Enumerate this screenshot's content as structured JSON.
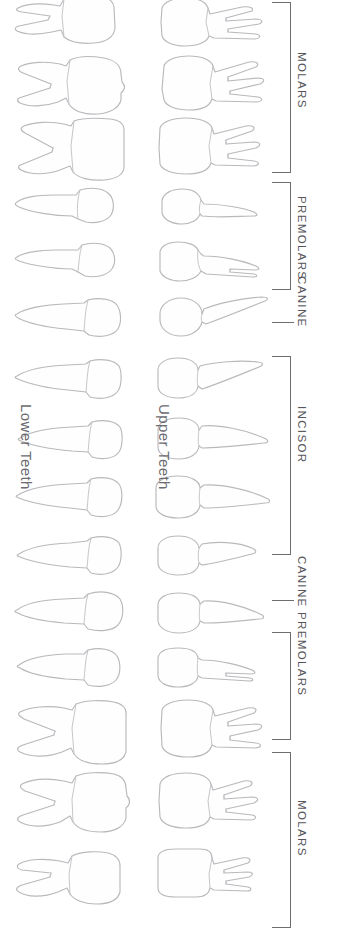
{
  "figure": {
    "background_color": "#ffffff",
    "outline_color": "#b9b9bd",
    "bracket_color": "#6d6d72",
    "label_color": "#55555a"
  },
  "arch_labels": [
    {
      "name": "lower-teeth-label",
      "text": "Lower Teeth",
      "x": 34,
      "y": 404
    },
    {
      "name": "upper-teeth-label",
      "text": "Upper Teeth",
      "x": 172,
      "y": 404
    }
  ],
  "groups": [
    {
      "name": "molars-upper",
      "label": "MOLARS",
      "marker": "bracket",
      "top": 2,
      "height": 171,
      "label_y": 52
    },
    {
      "name": "premolars-upper",
      "label": "PREMOLARS",
      "marker": "bracket",
      "top": 182,
      "height": 108,
      "label_y": 196
    },
    {
      "name": "canine-upper",
      "label": "CANINE",
      "marker": "tick",
      "top": 322,
      "height": 0,
      "label_y": 276
    },
    {
      "name": "incisor",
      "label": "INCISOR",
      "marker": "bracket",
      "top": 356,
      "height": 199,
      "label_y": 406
    },
    {
      "name": "canine-lower",
      "label": "CANINE",
      "marker": "tick",
      "top": 600,
      "height": 0,
      "label_y": 556
    },
    {
      "name": "premolars-lower",
      "label": "PREMOLARS",
      "marker": "bracket",
      "top": 632,
      "height": 108,
      "label_y": 612
    },
    {
      "name": "molars-lower",
      "label": "MOLARS",
      "marker": "bracket",
      "top": 752,
      "height": 176,
      "label_y": 800
    }
  ],
  "columns": [
    {
      "name": "lower-teeth-column",
      "side": "lower",
      "x": 14,
      "orientation": "root-left-crown-right"
    },
    {
      "name": "upper-teeth-column",
      "side": "upper",
      "x": 152,
      "orientation": "crown-left-root-right"
    }
  ],
  "rows": [
    {
      "name": "third-molar-row",
      "group": "molars",
      "y": 0,
      "lower_tooth": "lower-third-molar",
      "upper_tooth": "upper-third-molar"
    },
    {
      "name": "second-molar-row",
      "group": "molars",
      "y": 58,
      "lower_tooth": "lower-second-molar",
      "upper_tooth": "upper-second-molar"
    },
    {
      "name": "first-molar-row",
      "group": "molars",
      "y": 120,
      "lower_tooth": "lower-first-molar",
      "upper_tooth": "upper-first-molar"
    },
    {
      "name": "second-premolar-row",
      "group": "premolars",
      "y": 186,
      "lower_tooth": "lower-second-premolar",
      "upper_tooth": "upper-second-premolar"
    },
    {
      "name": "first-premolar-row",
      "group": "premolars",
      "y": 240,
      "lower_tooth": "lower-first-premolar",
      "upper_tooth": "upper-first-premolar"
    },
    {
      "name": "canine-upper-row",
      "group": "canine",
      "y": 296,
      "lower_tooth": "lower-canine-a",
      "upper_tooth": "upper-canine-a"
    },
    {
      "name": "lateral-incisor-row-1",
      "group": "incisor",
      "y": 358,
      "lower_tooth": "lower-incisor-1",
      "upper_tooth": "upper-incisor-1"
    },
    {
      "name": "central-incisor-row-1",
      "group": "incisor",
      "y": 418,
      "lower_tooth": "lower-incisor-2",
      "upper_tooth": "upper-incisor-2"
    },
    {
      "name": "central-incisor-row-2",
      "group": "incisor",
      "y": 476,
      "lower_tooth": "lower-incisor-3",
      "upper_tooth": "upper-incisor-3"
    },
    {
      "name": "canine-lower-row",
      "group": "canine",
      "y": 534,
      "lower_tooth": "lower-canine-b",
      "upper_tooth": "upper-canine-b"
    },
    {
      "name": "first-premolar-row-2",
      "group": "premolars",
      "y": 590,
      "lower_tooth": "lower-premolar-b1",
      "upper_tooth": "upper-premolar-b1"
    },
    {
      "name": "second-premolar-row-2",
      "group": "premolars",
      "y": 646,
      "lower_tooth": "lower-premolar-b2",
      "upper_tooth": "upper-premolar-b2"
    },
    {
      "name": "first-molar-row-2",
      "group": "molars",
      "y": 700,
      "lower_tooth": "lower-molar-b1",
      "upper_tooth": "upper-molar-b1"
    },
    {
      "name": "second-molar-row-2",
      "group": "molars",
      "y": 772,
      "lower_tooth": "lower-molar-b2",
      "upper_tooth": "upper-molar-b2"
    },
    {
      "name": "third-molar-row-2",
      "group": "molars",
      "y": 848,
      "lower_tooth": "lower-molar-b3",
      "upper_tooth": "upper-molar-b3"
    }
  ],
  "counts": {
    "total_teeth_drawn": 30,
    "rows": 15,
    "columns": 2,
    "bracket_groups": 5,
    "tick_groups": 2
  }
}
